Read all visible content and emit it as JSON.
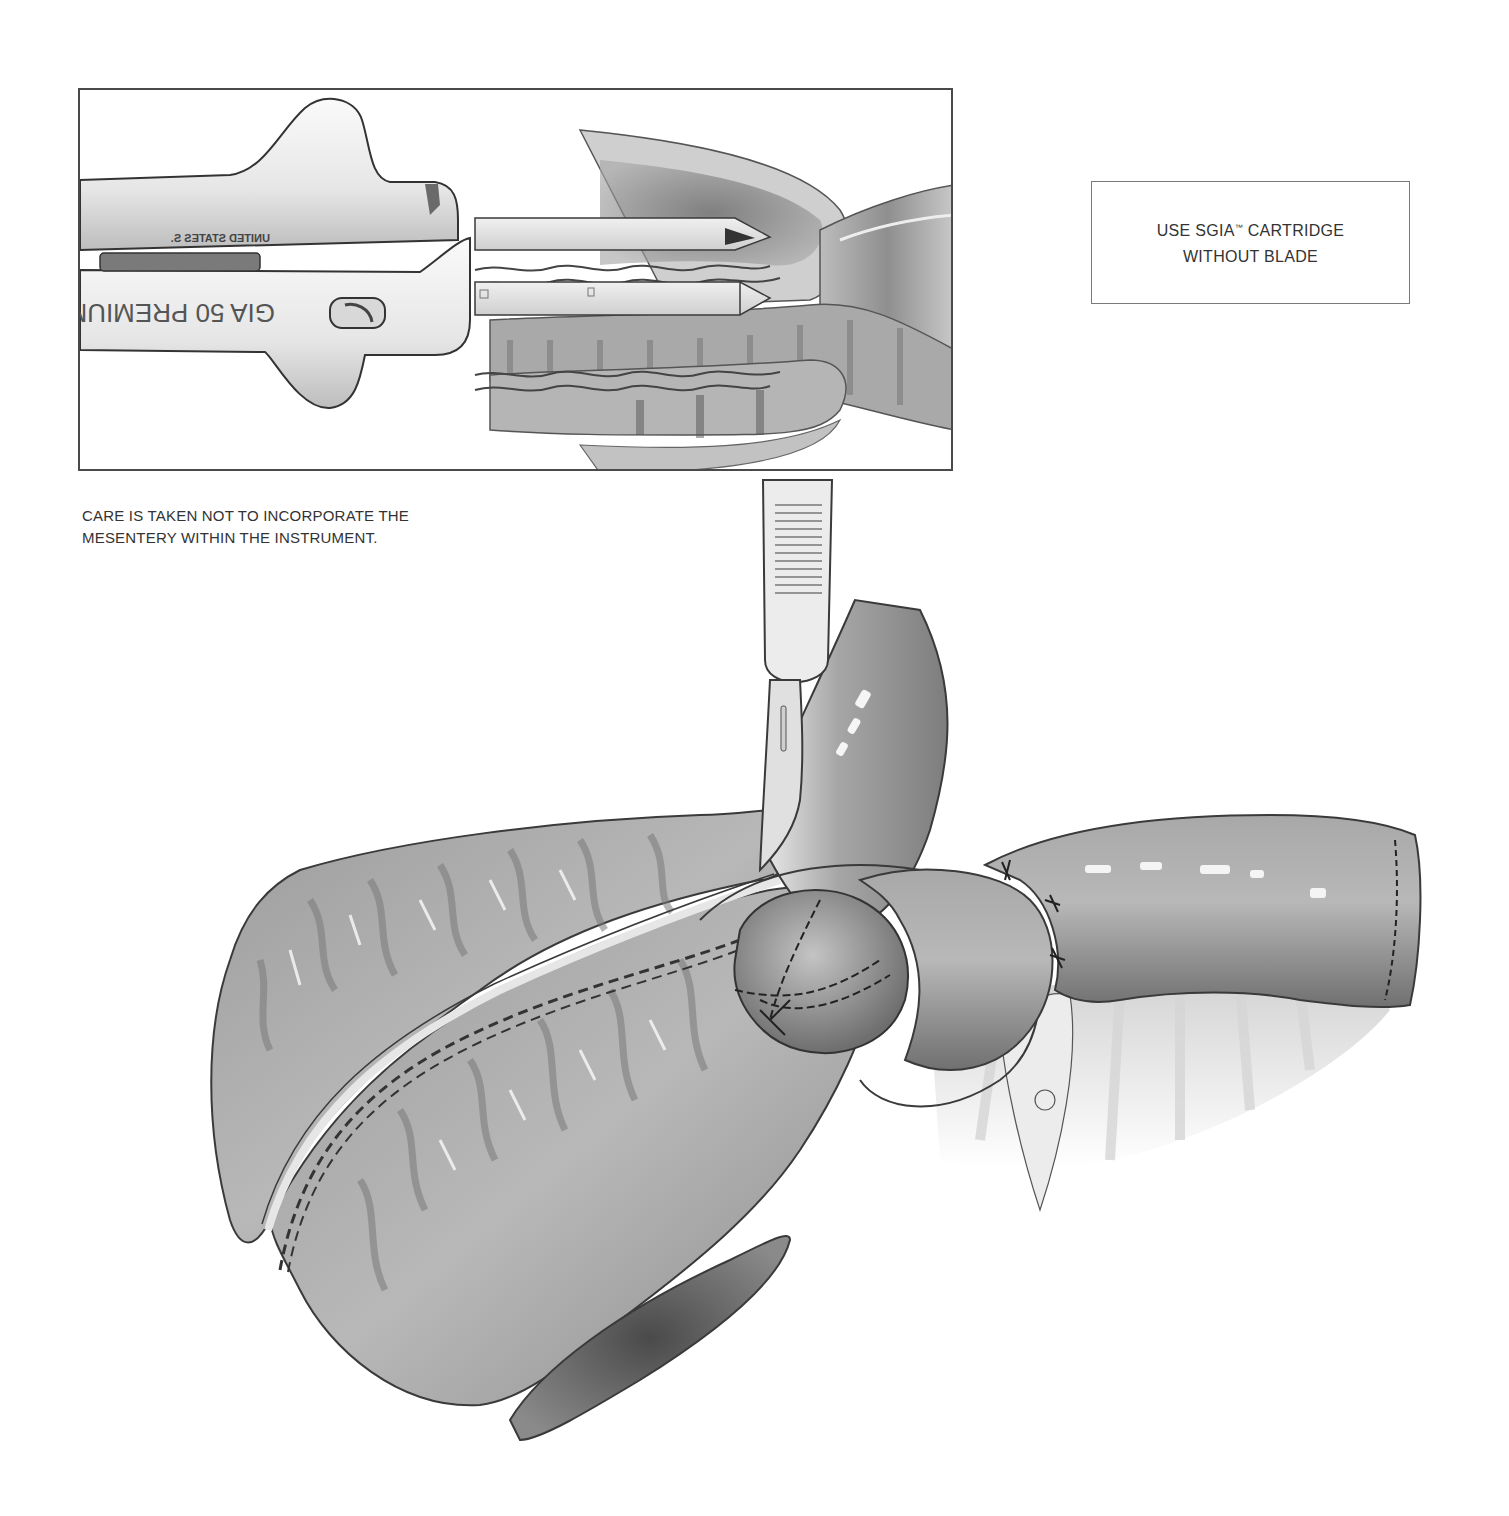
{
  "inset": {
    "instrument_text_primary": "GIA 50 PREMIUM",
    "instrument_text_secondary": "UNITED STATES S.",
    "text_orientation": "mirrored"
  },
  "note_box": {
    "line1_prefix": "USE SGIA",
    "line1_trademark": "™",
    "line1_suffix": " CARTRIDGE",
    "line2": "WITHOUT BLADE"
  },
  "caption": {
    "line1": "CARE IS TAKEN NOT TO INCORPORATE THE",
    "line2": "MESENTERY WITHIN THE INSTRUMENT."
  },
  "illustration": {
    "subjects": [
      "linear-stapler",
      "bowel-loop",
      "scalpel",
      "stapled-anastomosis",
      "mesentery"
    ],
    "palette": {
      "ink": "#2a2a2a",
      "tissue_dark": "#6b6b6b",
      "tissue_mid": "#9a9a9a",
      "tissue_light": "#c8c8c8",
      "highlight": "#f4f4f4",
      "frame": "#4a4a4a"
    }
  }
}
